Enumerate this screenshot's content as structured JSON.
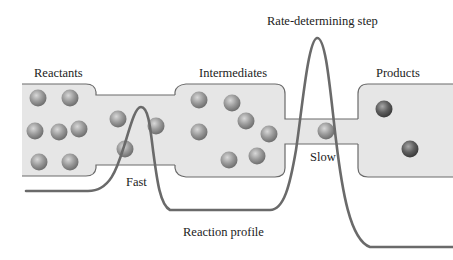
{
  "diagram": {
    "labels": {
      "reactants": "Reactants",
      "intermediates": "Intermediates",
      "products": "Products",
      "fast": "Fast",
      "slow": "Slow",
      "rate_determining_step": "Rate-determining step",
      "reaction_profile": "Reaction profile"
    },
    "colors": {
      "container_fill": "#e6e6e6",
      "container_stroke": "#6a6a6a",
      "curve": "#6a6a6a",
      "reactant_ball": "#9a9a9a",
      "product_ball": "#5f5f5f",
      "text": "#222222"
    },
    "counts": {
      "reactants": 7,
      "transit_fast": 3,
      "intermediates": 7,
      "transit_slow": 1,
      "products": 2
    }
  }
}
